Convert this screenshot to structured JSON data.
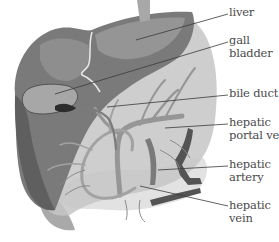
{
  "diagram": {
    "labels": [
      {
        "id": "liver",
        "lines": [
          "liver"
        ],
        "x": 229,
        "y": 6,
        "line_from": [
          228,
          14
        ],
        "line_to": [
          136,
          40
        ]
      },
      {
        "id": "gall-bladder",
        "lines": [
          "gall",
          "bladder"
        ],
        "x": 229,
        "y": 33,
        "line_from": [
          228,
          42
        ],
        "line_to": [
          55,
          94
        ]
      },
      {
        "id": "bile-duct",
        "lines": [
          "bile duct"
        ],
        "x": 229,
        "y": 87,
        "line_from": [
          228,
          95
        ],
        "line_to": [
          107,
          107
        ]
      },
      {
        "id": "hepatic-portal-vein",
        "lines": [
          "hepatic",
          "portal vein"
        ],
        "x": 229,
        "y": 116,
        "line_from": [
          228,
          124
        ],
        "line_to": [
          165,
          128
        ]
      },
      {
        "id": "hepatic-artery",
        "lines": [
          "hepatic",
          "artery"
        ],
        "x": 229,
        "y": 157,
        "line_from": [
          228,
          166
        ],
        "line_to": [
          158,
          170
        ]
      },
      {
        "id": "hepatic-vein",
        "lines": [
          "hepatic",
          "vein"
        ],
        "x": 229,
        "y": 198,
        "line_from": [
          228,
          206
        ],
        "line_to": [
          140,
          186
        ]
      }
    ],
    "colors": {
      "background": "#ffffff",
      "liver_dark": "#6e6e6e",
      "liver_mid": "#8c8c8c",
      "liver_light": "#b4b4b4",
      "translucent_lobe": "#c8c8c8",
      "vessel": "#9a9a9a",
      "vessel_dark": "#4e4e4e",
      "pale_organ": "#dcdcdc",
      "label_text": "#4a4a4a",
      "leader_line": "#3a3a3a"
    }
  }
}
